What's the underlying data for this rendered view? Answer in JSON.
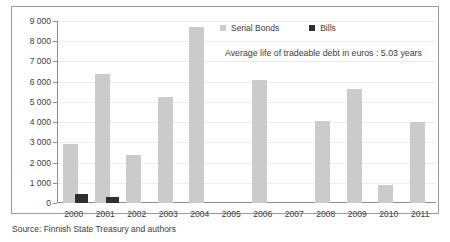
{
  "chart_data": {
    "type": "bar",
    "title": "",
    "subtitle": "",
    "xlabel": "",
    "ylabel": "",
    "categories": [
      "2000",
      "2001",
      "2002",
      "2003",
      "2004",
      "2005",
      "2006",
      "2007",
      "2008",
      "2009",
      "2010",
      "2011"
    ],
    "series": [
      {
        "name": "Serial Bonds",
        "color": "#cbcbcb",
        "values": [
          2900,
          6400,
          2350,
          5250,
          8700,
          0,
          6100,
          0,
          4050,
          5650,
          900,
          4000
        ]
      },
      {
        "name": "Bills",
        "color": "#2f2f2f",
        "values": [
          450,
          300,
          0,
          0,
          0,
          0,
          0,
          0,
          0,
          0,
          0,
          0
        ]
      }
    ],
    "ylim": [
      0,
      9000
    ],
    "ytick_step": 1000,
    "ytick_labels": [
      "9 000",
      "8 000",
      "7 000",
      "6 000",
      "5 000",
      "4 000",
      "3 000",
      "2 000",
      "1 000",
      "0"
    ],
    "ytick_values": [
      9000,
      8000,
      7000,
      6000,
      5000,
      4000,
      3000,
      2000,
      1000,
      0
    ],
    "grid": true,
    "legend_position": "top-right",
    "annotations": [
      "Average life of tradeable debt in euros : 5.03 years"
    ]
  },
  "legend": {
    "items": [
      {
        "label": "Serial Bonds",
        "color": "#cbcbcb"
      },
      {
        "label": "Bills",
        "color": "#2f2f2f"
      }
    ]
  },
  "annotation": {
    "text": "Average life of tradeable debt in euros : 5.03 years"
  },
  "source": {
    "text": "Source: Finnish State Treasury and authors"
  }
}
